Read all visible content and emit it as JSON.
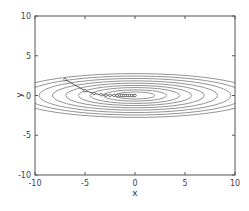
{
  "chart_data": {
    "type": "line",
    "subtype": "contour-with-optimization-path",
    "title": "",
    "xlabel": "x",
    "ylabel": "y",
    "xlim": [
      -10,
      10
    ],
    "ylim": [
      -10,
      10
    ],
    "xticks": [
      -10,
      -5,
      0,
      5,
      10
    ],
    "yticks": [
      -10,
      -5,
      0,
      5,
      10
    ],
    "xtick_labels": [
      "-10",
      "-5",
      "0",
      "5",
      "10"
    ],
    "ytick_labels": [
      "-10",
      "-5",
      "0",
      "5",
      "10"
    ],
    "grid": false,
    "legend": null,
    "contours": {
      "function": "f(x, y) = x^2/20 + y^2",
      "center": [
        0,
        0
      ],
      "levels": [
        0.2,
        0.5,
        1,
        1.6,
        2.4,
        3.4,
        4.6,
        6,
        7.6
      ],
      "color": "#888888"
    },
    "path": {
      "marker": "circle",
      "color": "#333333",
      "x": [
        -7.0,
        -5.0,
        -4.1,
        -3.4,
        -2.9,
        -2.5,
        -2.1,
        -1.8,
        -1.5,
        -1.3,
        -1.1,
        -0.9,
        -0.7,
        -0.5,
        -0.3,
        -0.1,
        0.0
      ],
      "y": [
        2.0,
        0.6,
        0.25,
        0.1,
        0.04,
        0.02,
        0.01,
        0.0,
        0.0,
        0.0,
        0.0,
        0.0,
        0.0,
        0.0,
        0.0,
        0.0,
        0.0
      ]
    }
  },
  "axes": {
    "xlabel": "x",
    "ylabel": "y"
  }
}
